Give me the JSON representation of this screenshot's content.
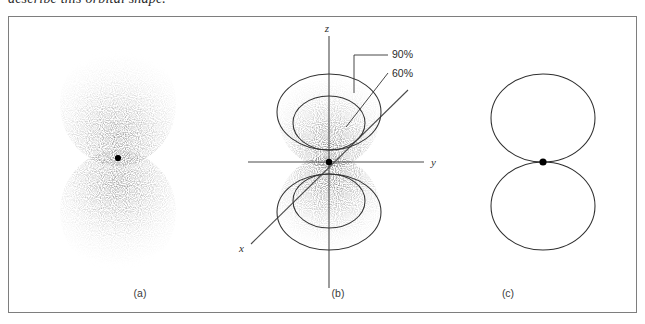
{
  "page": {
    "running_text": "describe this orbital shape.",
    "background_color": "#ffffff",
    "frame_border_color": "#7e7e7e"
  },
  "figure": {
    "panels": [
      {
        "id": "a",
        "caption": "(a)",
        "kind": "electron-density-dot-cloud",
        "description": "p-orbital electron probability dot density plot, two lobes above and below nucleus",
        "nucleus_color": "#000000",
        "dot_color": "#6f6f6f"
      },
      {
        "id": "b",
        "caption": "(b)",
        "kind": "contour-overlay-on-dot-cloud",
        "description": "Same dot cloud with 90% and 60% probability contour boundaries and xyz axes",
        "axes": [
          {
            "name": "z",
            "label": "z",
            "orientation": "vertical"
          },
          {
            "name": "y",
            "label": "y",
            "orientation": "horizontal"
          },
          {
            "name": "x",
            "label": "x",
            "orientation": "diagonal-lower-left"
          }
        ],
        "contours": [
          {
            "label": "90%",
            "level": 90
          },
          {
            "label": "60%",
            "level": 60
          }
        ],
        "axis_color": "#4a4a4a",
        "contour_color": "#333333"
      },
      {
        "id": "c",
        "caption": "(c)",
        "kind": "boundary-surface",
        "description": "Boundary-surface representation: two tangent ellipses meeting at the nucleus",
        "outline_color": "#2f2f2f",
        "nucleus_color": "#000000"
      }
    ]
  }
}
